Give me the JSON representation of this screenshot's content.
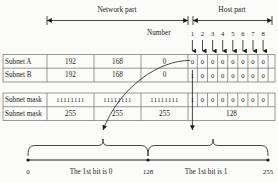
{
  "figure": {
    "colors": {
      "ink": "#1b1b1b",
      "rule": "#6f6f6f",
      "background": "#fbfbfa"
    }
  },
  "header": {
    "network_part": "Network part",
    "host_part": "Host part",
    "number_label": "Number",
    "bit_numbers": [
      "1",
      "2",
      "3",
      "4",
      "5",
      "6",
      "7",
      "8"
    ]
  },
  "table": {
    "rows": [
      {
        "label": "Subnet A",
        "octets": [
          "192",
          "168",
          "0"
        ],
        "bits": [
          "0",
          "0",
          "0",
          "0",
          "0",
          "0",
          "0",
          "0"
        ]
      },
      {
        "label": "Subnet B",
        "octets": [
          "192",
          "168",
          "0"
        ],
        "bits": [
          "1",
          "0",
          "0",
          "0",
          "0",
          "0",
          "0",
          "0"
        ]
      },
      {
        "label": "Subnet mask",
        "octets": [
          "11111111",
          "11111111",
          "11111111"
        ],
        "bits": [
          "1",
          "0",
          "0",
          "0",
          "0",
          "0",
          "0",
          "0"
        ]
      },
      {
        "label": "Subnet mask",
        "octets": [
          "255",
          "255",
          "255"
        ],
        "bits": [],
        "last_octet_decimal": "128"
      }
    ]
  },
  "axis": {
    "start": "0",
    "middle": "128",
    "end": "255",
    "left_caption": "The 1st bit is 0",
    "right_caption": "The 1st bit is 1"
  }
}
